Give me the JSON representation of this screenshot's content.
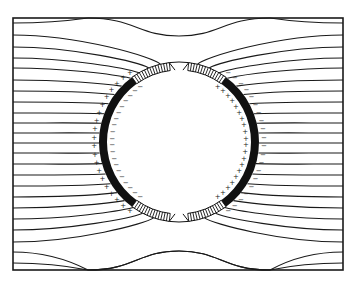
{
  "figure": {
    "frame": {
      "x": 13,
      "y": 18,
      "width": 330,
      "height": 252
    },
    "sphere": {
      "cx": 179,
      "cy": 142,
      "outer_r": 80,
      "inner_r": 72
    },
    "hatched_half_angle_deg": 36,
    "gap_half_angle_deg": 7,
    "field_lines": {
      "count": 24,
      "left_edge_y": [
        23,
        35,
        47,
        58,
        68,
        80,
        91,
        102,
        113,
        123,
        133,
        143,
        153,
        164,
        175,
        186,
        197,
        208,
        219,
        230,
        242,
        252,
        263
      ],
      "direction": "left-to-right"
    },
    "charges": {
      "left_outside": "+",
      "left_inside": "−",
      "right_outside": "−",
      "right_inside": "+"
    },
    "colors": {
      "ink": "#111111",
      "background": "#ffffff"
    }
  }
}
